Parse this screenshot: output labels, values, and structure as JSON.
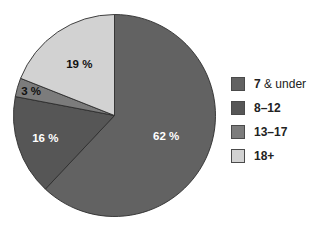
{
  "chart_data": {
    "type": "pie",
    "title": "",
    "categories": [
      "7 & under",
      "8–12",
      "13–17",
      "18+"
    ],
    "values": [
      62,
      16,
      3,
      19
    ],
    "unit": "%",
    "slice_labels": [
      "62 %",
      "16 %",
      "3 %",
      "19 %"
    ],
    "colors": [
      "#626262",
      "#565656",
      "#7c7c7c",
      "#d2d2d2"
    ],
    "label_colors": [
      "#ffffff",
      "#ffffff",
      "#111111",
      "#111111"
    ],
    "start_angle": "12 o'clock",
    "direction": "clockwise",
    "legend_position": "right"
  },
  "legend": {
    "items": [
      {
        "bold": "7",
        "rest": " & under",
        "color": "#626262"
      },
      {
        "bold": "8–12",
        "rest": "",
        "color": "#565656"
      },
      {
        "bold": "13–17",
        "rest": "",
        "color": "#7c7c7c"
      },
      {
        "bold": "18+",
        "rest": "",
        "color": "#d2d2d2"
      }
    ]
  }
}
